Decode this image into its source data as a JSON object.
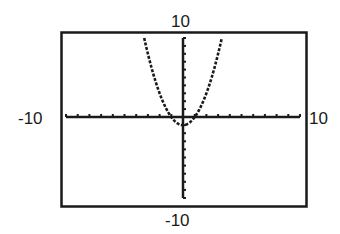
{
  "chart_data": {
    "type": "line",
    "title": "",
    "function": "y = x^2 - 1",
    "xlabel": "",
    "ylabel": "",
    "xlim": [
      -10,
      10
    ],
    "ylim": [
      -10,
      10
    ],
    "xscale": 1,
    "yscale": 1,
    "grid": false,
    "legend": null,
    "window_labels": {
      "xmin": "-10",
      "xmax": "10",
      "ymin": "-10",
      "ymax": "10"
    },
    "series": [
      {
        "name": "y = x^2 - 1",
        "style": "dotted",
        "x": [
          -3.3,
          -3,
          -2.5,
          -2,
          -1.5,
          -1,
          -0.5,
          0,
          0.5,
          1,
          1.5,
          2,
          2.5,
          3,
          3.3
        ],
        "y": [
          9.89,
          8,
          5.25,
          3,
          1.25,
          0,
          -0.75,
          -1,
          -0.75,
          0,
          1.25,
          3,
          5.25,
          8,
          9.89
        ]
      }
    ],
    "features": {
      "vertex": [
        0,
        -1
      ],
      "x_intercepts": [
        -1,
        1
      ],
      "y_intercept": -1
    }
  },
  "style": {
    "line_color": "#1a1a1a",
    "frame_color": "#1a1a1a",
    "background": "#ffffff"
  }
}
